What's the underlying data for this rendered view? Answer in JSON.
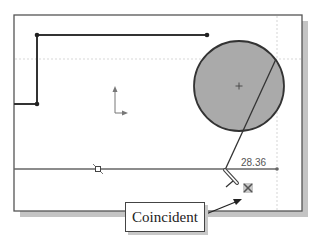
{
  "sketch": {
    "dimension_value": "28.36",
    "callout_label": "Coincident"
  },
  "icons": {
    "origin": "origin-axes-icon",
    "midpoint": "midpoint-constraint-icon",
    "coincident": "coincident-relation-icon",
    "pencil_cursor": "sketch-pencil-cursor-icon"
  },
  "colors": {
    "background": "#ffffff",
    "frame_border": "#555555",
    "frame_shadow": "#c4c4c4",
    "sketch_line": "#333333",
    "circle_fill": "#aaaaaa",
    "circle_stroke": "#333333",
    "inference_dotted": "#d8d8d8",
    "dimension_text": "#555555"
  }
}
